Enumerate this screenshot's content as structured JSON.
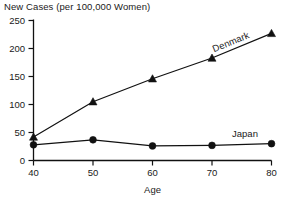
{
  "chart_data": {
    "type": "line",
    "title": "New Cases (per 100,000 Women)",
    "xlabel": "Age",
    "ylabel": "",
    "x": [
      40,
      50,
      60,
      70,
      80
    ],
    "xticklabels": [
      "40",
      "50",
      "60",
      "70",
      "80"
    ],
    "yticklabels": [
      "0",
      "50",
      "100",
      "150",
      "200",
      "250"
    ],
    "yticks": [
      0,
      50,
      100,
      150,
      200,
      250
    ],
    "xlim": [
      40,
      80
    ],
    "ylim": [
      0,
      250
    ],
    "grid": false,
    "legend": "inline-annotations",
    "series": [
      {
        "name": "Denmark",
        "marker": "triangle",
        "values": [
          42,
          105,
          146,
          183,
          227
        ],
        "label": "Denmark",
        "label_rotation": -22
      },
      {
        "name": "Japan",
        "marker": "circle",
        "values": [
          28,
          37,
          26,
          27,
          30
        ],
        "label": "Japan",
        "label_rotation": 0
      }
    ],
    "colors": {
      "line": "#111111",
      "marker": "#111111",
      "text": "#1a1a1a",
      "background": "#ffffff"
    }
  }
}
